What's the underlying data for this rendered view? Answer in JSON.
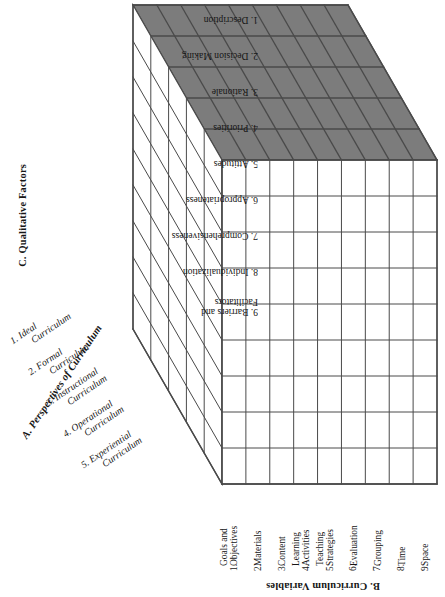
{
  "figure": {
    "type": "3d-matrix-cube",
    "colors": {
      "top_face_fill": "#7c7c7c",
      "face_fill": "#ffffff",
      "line": "#4a4a4a",
      "text": "#161616"
    },
    "geometry": {
      "front_rows": 9,
      "front_cols": 9,
      "top_rows": 5,
      "top_cols": 9,
      "side_rows": 9,
      "side_cols": 5
    }
  },
  "axis_a": {
    "title": "A. Perspectives of Curriculum",
    "items": [
      {
        "num": "1.",
        "line1": "Ideal",
        "line2": "Curriculum"
      },
      {
        "num": "2.",
        "line1": "Formal",
        "line2": "Curriculum"
      },
      {
        "num": "3.",
        "line1": "Instructional",
        "line2": "Curriculum"
      },
      {
        "num": "4.",
        "line1": "Operational",
        "line2": "Curriculum"
      },
      {
        "num": "5.",
        "line1": "Experiential",
        "line2": "Curriculum"
      }
    ]
  },
  "axis_b": {
    "title": "B. Curriculum Variables",
    "items": [
      {
        "num": "1.",
        "line1": "Goals and",
        "line2": "Objectives"
      },
      {
        "num": "2.",
        "line1": "Materials",
        "line2": ""
      },
      {
        "num": "3.",
        "line1": "Content",
        "line2": ""
      },
      {
        "num": "4.",
        "line1": "Learning",
        "line2": "Activities"
      },
      {
        "num": "5.",
        "line1": "Teaching",
        "line2": "Strategies"
      },
      {
        "num": "6.",
        "line1": "Evaluation",
        "line2": ""
      },
      {
        "num": "7.",
        "line1": "Grouping",
        "line2": ""
      },
      {
        "num": "8.",
        "line1": "Time",
        "line2": ""
      },
      {
        "num": "9.",
        "line1": "Space",
        "line2": ""
      }
    ]
  },
  "axis_c": {
    "title": "C. Qualitative Factors",
    "items": [
      {
        "num": "1.",
        "line1": "Description",
        "line2": ""
      },
      {
        "num": "2.",
        "line1": "Decision Making",
        "line2": ""
      },
      {
        "num": "3.",
        "line1": "Rationale",
        "line2": ""
      },
      {
        "num": "4.",
        "line1": "Priorities",
        "line2": ""
      },
      {
        "num": "5.",
        "line1": "Attitudes",
        "line2": ""
      },
      {
        "num": "6.",
        "line1": "Appropriateness",
        "line2": ""
      },
      {
        "num": "7.",
        "line1": "Comprehensiveness",
        "line2": ""
      },
      {
        "num": "8.",
        "line1": "Individualization",
        "line2": ""
      },
      {
        "num": "9.",
        "line1": "Barriers and",
        "line2": "Facilitators"
      }
    ]
  }
}
